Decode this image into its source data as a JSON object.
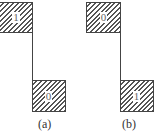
{
  "figures": [
    {
      "id": "a",
      "caption": "(a)",
      "top_box": {
        "label": "1"
      },
      "bottom_box": {
        "label": "0"
      }
    },
    {
      "id": "b",
      "caption": "(b)",
      "top_box": {
        "label": "0"
      },
      "bottom_box": {
        "label": "1"
      }
    }
  ]
}
